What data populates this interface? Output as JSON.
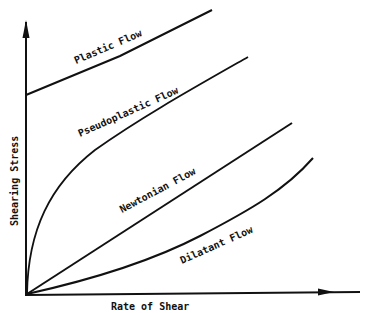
{
  "axes": {
    "x_label": "Rate of Shear",
    "y_label": "Shearing Stress"
  },
  "curves": [
    {
      "name": "Plastic Flow",
      "label": "Plastic Flow"
    },
    {
      "name": "Pseudoplastic Flow",
      "label": "Pseudoplastic Flow"
    },
    {
      "name": "Newtonian Flow",
      "label": "Newtonian Flow"
    },
    {
      "name": "Dilatant Flow",
      "label": "Dilatant Flow"
    }
  ],
  "colors": {
    "line": "#111111",
    "background": "#ffffff"
  }
}
